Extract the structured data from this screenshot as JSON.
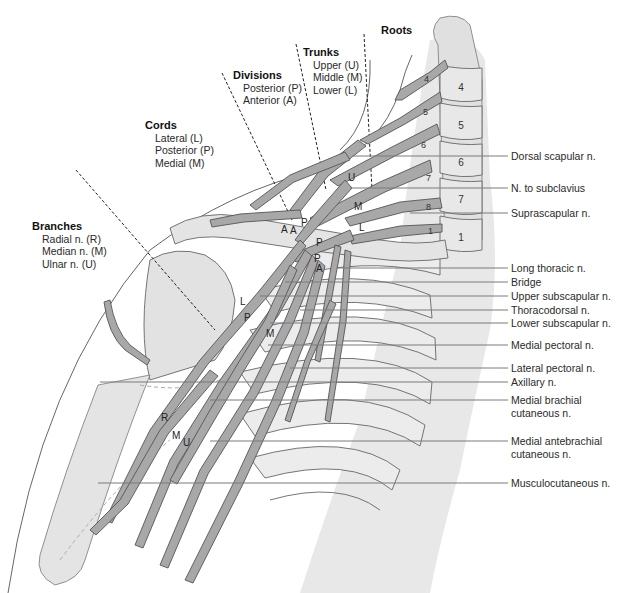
{
  "diagram": {
    "colors": {
      "nerve_fill": "#a8a8a8",
      "nerve_stroke": "#555555",
      "bone_fill": "#dcdcdc",
      "body_shade": "#e6e6e6",
      "leader_line": "#7a7a7a",
      "guide_dashed": "#222222"
    }
  },
  "groups": {
    "roots": {
      "title": "Roots"
    },
    "trunks": {
      "title": "Trunks",
      "items": [
        "Upper (U)",
        "Middle (M)",
        "Lower (L)"
      ]
    },
    "divisions": {
      "title": "Divisions",
      "items": [
        "Posterior (P)",
        "Anterior (A)"
      ]
    },
    "cords": {
      "title": "Cords",
      "items": [
        "Lateral (L)",
        "Posterior (P)",
        "Medial (M)"
      ]
    },
    "branches": {
      "title": "Branches",
      "items": [
        "Radial n. (R)",
        "Median n. (M)",
        "Ulnar n. (U)"
      ]
    }
  },
  "vertebra_labels": [
    "4",
    "5",
    "6",
    "7",
    "1"
  ],
  "root_labels": [
    "4",
    "5",
    "6",
    "7",
    "8",
    "1"
  ],
  "inline_letters": {
    "trunk_upper": "U",
    "trunk_middle": "M",
    "trunk_lower": "L",
    "div_a1": "A",
    "div_a2": "A",
    "div_p1": "P",
    "div_p2": "P",
    "div_p3": "P",
    "div_a3": "A",
    "cord_lateral": "L",
    "cord_posterior": "P",
    "cord_medial": "M",
    "branch_radial": "R",
    "branch_median": "M",
    "branch_ulnar": "U"
  },
  "right_labels": [
    {
      "text": "Dorsal scapular n.",
      "y": 156
    },
    {
      "text": "N. to subclavius",
      "y": 188
    },
    {
      "text": "Suprascapular n.",
      "y": 213
    },
    {
      "text": "Long thoracic n.",
      "y": 268
    },
    {
      "text": "Bridge",
      "y": 282
    },
    {
      "text": "Upper subscapular n.",
      "y": 296
    },
    {
      "text": "Thoracodorsal n.",
      "y": 310
    },
    {
      "text": "Lower subscapular n.",
      "y": 323
    },
    {
      "text": "Medial pectoral n.",
      "y": 345
    },
    {
      "text": "Lateral pectoral n.",
      "y": 368
    },
    {
      "text": "Axillary n.",
      "y": 382
    },
    {
      "text": "Medial brachial",
      "y2": "cutaneous n.",
      "y": 400
    },
    {
      "text": "Medial antebrachial",
      "y2": "cutaneous n.",
      "y": 441
    },
    {
      "text": "Musculocutaneous n.",
      "y": 483
    }
  ]
}
